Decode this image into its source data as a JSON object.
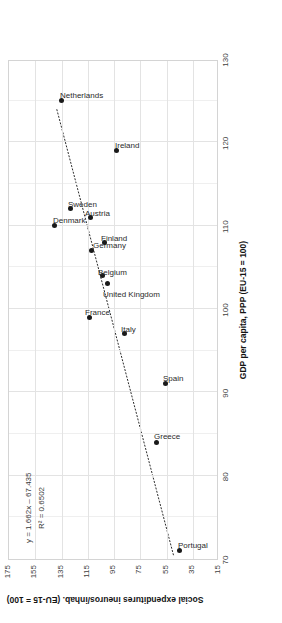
{
  "chart_data": {
    "type": "scatter",
    "title": "",
    "xlabel": "GDP per capita, PPP (EU-15 = 100)",
    "ylabel": "Social expenditures ineuros/inhab. (EU-15 = 100)",
    "xlim": [
      70,
      130
    ],
    "ylim": [
      15,
      175
    ],
    "xticks": [
      "70",
      "80",
      "90",
      "100",
      "110",
      "120",
      "130"
    ],
    "yticks": [
      "175",
      "155",
      "135",
      "115",
      "95",
      "75",
      "55",
      "35",
      "15"
    ],
    "grid": true,
    "legend": "none",
    "points": [
      {
        "label": "Portugal",
        "x": 71.0,
        "y": 45
      },
      {
        "label": "Greece",
        "x": 84.0,
        "y": 63
      },
      {
        "label": "Spain",
        "x": 91.0,
        "y": 56
      },
      {
        "label": "Italy",
        "x": 97.0,
        "y": 87
      },
      {
        "label": "France",
        "x": 99.0,
        "y": 114
      },
      {
        "label": "United Kingdom",
        "x": 103.0,
        "y": 100
      },
      {
        "label": "Belgium",
        "x": 104.0,
        "y": 104
      },
      {
        "label": "Germany",
        "x": 107.0,
        "y": 112
      },
      {
        "label": "Finland",
        "x": 108.0,
        "y": 102
      },
      {
        "label": "Austria",
        "x": 111.0,
        "y": 113
      },
      {
        "label": "Denmark",
        "x": 110.0,
        "y": 140
      },
      {
        "label": "Sweden",
        "x": 112.0,
        "y": 128
      },
      {
        "label": "Ireland",
        "x": 119.0,
        "y": 93
      },
      {
        "label": "Netherlands",
        "x": 125.0,
        "y": 135
      }
    ],
    "trendline": {
      "style": "dotted",
      "slope": 1.662,
      "intercept": -67.435,
      "r_squared": 0.6502,
      "x_start": 70.5,
      "x_end": 124.0
    },
    "annotations": {
      "equation": "y = 1.662x – 67.435",
      "r2": "R² = 0.6502"
    }
  }
}
